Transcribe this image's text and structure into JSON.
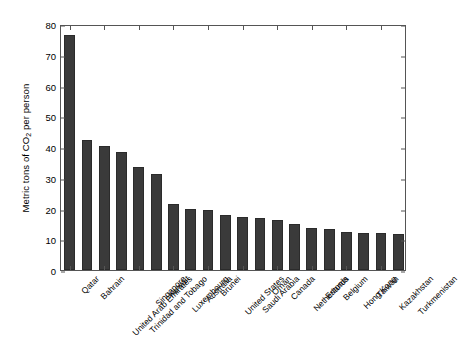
{
  "chart_data": {
    "type": "bar",
    "title": "",
    "subtitle": "",
    "xlabel": "",
    "ylabel": "Metric tons of CO2 per person",
    "ylabel_parts": {
      "before": "Metric tons of CO",
      "sub": "2",
      "after": " per person"
    },
    "ylim": [
      0,
      80
    ],
    "yticks": [
      0,
      10,
      20,
      30,
      40,
      50,
      60,
      70,
      80
    ],
    "ytick_labels": [
      "0",
      "10",
      "20",
      "30",
      "40",
      "50",
      "60",
      "70",
      "80"
    ],
    "grid": false,
    "legend": null,
    "bar_color": "#3a3a3a",
    "axis_color": "#555555",
    "background": "#ffffff",
    "categories": [
      "Qatar",
      "Bahrain",
      "United Arab Emirates",
      "Trinidad and Tobago",
      "Singapore",
      "Kuwait",
      "Luxembourg",
      "Australia",
      "Brunei",
      "United States",
      "Saudi Arabia",
      "Oman",
      "Canada",
      "Netherlands",
      "Estonia",
      "Belgium",
      "Hong Kong",
      "Taiwan",
      "Kazakhstan",
      "Turkmenistan"
    ],
    "values": [
      76.3,
      42.3,
      40.2,
      38.5,
      33.6,
      31.3,
      21.5,
      19.7,
      19.5,
      17.9,
      17.3,
      16.9,
      16.2,
      15.1,
      13.7,
      13.3,
      12.4,
      12.1,
      12.0,
      11.6
    ]
  }
}
